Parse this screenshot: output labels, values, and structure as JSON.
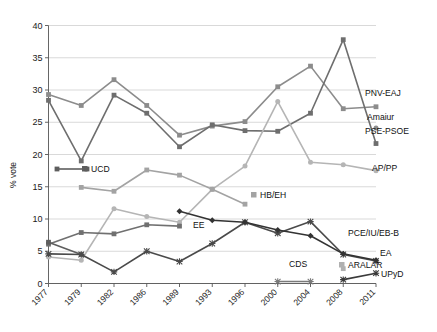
{
  "chart_data": {
    "type": "line",
    "title": "",
    "xlabel": "",
    "ylabel": "% vote",
    "ylim": [
      0,
      40
    ],
    "yticks": [
      0,
      5,
      10,
      15,
      20,
      25,
      30,
      35,
      40
    ],
    "grid": true,
    "legend_position": "right-inline",
    "categories": [
      "1977",
      "1979",
      "1982",
      "1986",
      "1989",
      "1993",
      "1996",
      "2000",
      "2004",
      "2008",
      "2011"
    ],
    "series": [
      {
        "name": "PNV-EAJ",
        "label": "PNV-EAJ",
        "color": "#8c8c8c",
        "marker": "square",
        "values": [
          29.3,
          27.6,
          31.6,
          27.6,
          23.0,
          24.4,
          25.1,
          30.5,
          33.7,
          27.1,
          27.4
        ]
      },
      {
        "name": "PSE-PSOE",
        "label": "PSE-PSOE",
        "color": "#6e6e6e",
        "marker": "square",
        "values": [
          28.4,
          19.0,
          29.2,
          26.4,
          21.2,
          24.6,
          23.7,
          23.6,
          26.4,
          37.8,
          21.7
        ]
      },
      {
        "name": "AP/PP",
        "label": "AP/PP",
        "color": "#b5b5b5",
        "marker": "circle",
        "values": [
          4.1,
          3.6,
          11.6,
          10.4,
          9.5,
          14.6,
          18.2,
          28.2,
          18.8,
          18.4,
          17.5
        ]
      },
      {
        "name": "HB/EH",
        "label": "HB/EH",
        "color": "#a3a3a3",
        "marker": "square",
        "values": [
          null,
          14.9,
          14.3,
          17.6,
          16.8,
          14.6,
          12.3,
          null,
          null,
          null,
          null
        ]
      },
      {
        "name": "Amaiur",
        "label": "Amaiur",
        "color": "#8c8c8c",
        "marker": "circle",
        "values": [
          null,
          null,
          null,
          null,
          null,
          null,
          null,
          null,
          null,
          null,
          24.1
        ]
      },
      {
        "name": "EE",
        "label": "EE",
        "color": "#707070",
        "marker": "square",
        "values": [
          6.1,
          7.9,
          7.7,
          9.1,
          8.9,
          null,
          null,
          null,
          null,
          null,
          null
        ]
      },
      {
        "name": "UCD",
        "label": "UCD",
        "color": "#5e5e5e",
        "marker": "square",
        "values": [
          6.4,
          4.5,
          null,
          null,
          null,
          null,
          null,
          null,
          null,
          null,
          null
        ]
      },
      {
        "name": "PCE/IU/EB-B",
        "label": "PCE/IU/EB-B",
        "color": "#4a4a4a",
        "marker": "cross",
        "values": [
          4.6,
          4.5,
          1.8,
          5.0,
          3.4,
          6.2,
          9.5,
          7.8,
          9.6,
          4.5,
          3.5
        ]
      },
      {
        "name": "EA",
        "label": "EA",
        "color": "#333333",
        "marker": "diamond",
        "values": [
          null,
          null,
          null,
          null,
          11.2,
          9.8,
          9.5,
          8.3,
          7.4,
          4.6,
          3.6
        ]
      },
      {
        "name": "ARALAR",
        "label": "ARALAR",
        "color": "#b0b0b0",
        "marker": "square",
        "values": [
          null,
          null,
          null,
          null,
          null,
          null,
          null,
          null,
          null,
          2.3,
          null
        ]
      },
      {
        "name": "CDS",
        "label": "CDS",
        "color": "#7a7a7a",
        "marker": "cross",
        "values": [
          null,
          null,
          null,
          null,
          null,
          null,
          null,
          0.3,
          0.3,
          null,
          null
        ]
      },
      {
        "name": "UPyD",
        "label": "UPyD",
        "color": "#3a3a3a",
        "marker": "cross",
        "values": [
          null,
          null,
          null,
          null,
          null,
          null,
          null,
          null,
          null,
          0.6,
          1.6
        ]
      }
    ],
    "inline_legend": [
      {
        "label": "UCD",
        "x": 91,
        "y": 172,
        "swatch": true,
        "swatch_color": "#5e5e5e"
      },
      {
        "label": "EE",
        "x": 193,
        "y": 228,
        "swatch": false
      },
      {
        "label": "HB/EH",
        "x": 260,
        "y": 198,
        "swatch": true,
        "swatch_color": "#a3a3a3"
      },
      {
        "label": "PNV-EAJ",
        "x": 365,
        "y": 96,
        "swatch": false
      },
      {
        "label": "Amaiur",
        "x": 367,
        "y": 120,
        "swatch": false
      },
      {
        "label": "PSE-PSOE",
        "x": 365,
        "y": 134,
        "swatch": false
      },
      {
        "label": "AP/PP",
        "x": 372,
        "y": 171,
        "swatch": false
      },
      {
        "label": "PCE/IU/EB-B",
        "x": 348,
        "y": 236,
        "swatch": false
      },
      {
        "label": "EA",
        "x": 380,
        "y": 256,
        "swatch": false
      },
      {
        "label": "ARALAR",
        "x": 348,
        "y": 268,
        "swatch": true,
        "swatch_color": "#b0b0b0"
      },
      {
        "label": "CDS",
        "x": 289,
        "y": 267,
        "swatch": false
      },
      {
        "label": "UPyD",
        "x": 381,
        "y": 277,
        "swatch": false
      }
    ]
  },
  "axis": {
    "y_label": "% vote",
    "y_ticks": [
      "0",
      "5",
      "10",
      "15",
      "20",
      "25",
      "30",
      "35",
      "40"
    ],
    "x_ticks": [
      "1977",
      "1979",
      "1982",
      "1986",
      "1989",
      "1993",
      "1996",
      "2000",
      "2004",
      "2008",
      "2011"
    ]
  },
  "caption": {
    "text": ""
  }
}
